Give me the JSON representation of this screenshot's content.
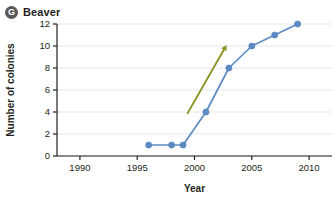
{
  "panel": {
    "badge": "G",
    "title": "Beaver"
  },
  "chart_data": {
    "type": "line",
    "title": "Beaver",
    "xlabel": "Year",
    "ylabel": "Number of colonies",
    "xlim": [
      1988,
      2012
    ],
    "ylim": [
      0,
      12
    ],
    "xticks": [
      1990,
      1995,
      2000,
      2005,
      2010
    ],
    "xtick_labels": [
      "1990",
      "1995",
      "2000",
      "2005",
      "2010"
    ],
    "yticks": [
      0,
      2,
      4,
      6,
      8,
      10,
      12
    ],
    "ytick_labels": [
      "0",
      "2",
      "4",
      "6",
      "8",
      "10",
      "12"
    ],
    "grid": "horizontal",
    "legend": "none",
    "series": [
      {
        "name": "Number of colonies",
        "color": "#5b8bc2",
        "marker": "circle",
        "x": [
          1996,
          1998,
          1999,
          2001,
          2003,
          2005,
          2007,
          2009
        ],
        "values": [
          1,
          1,
          1,
          4,
          8,
          10,
          11,
          12
        ]
      }
    ],
    "annotations": [
      {
        "type": "arrow",
        "label": "growth trend arrow",
        "color": "#8d9323",
        "x_start": 1999.4,
        "y_start": 3.9,
        "x_end": 2002.8,
        "y_end": 10.1
      }
    ]
  }
}
